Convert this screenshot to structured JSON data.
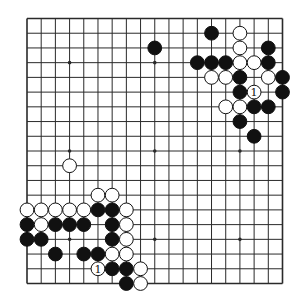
{
  "board": {
    "size": 19,
    "colors": {
      "background": "#ffffff",
      "line": "#2a2a2a",
      "black_stone": "#111111",
      "white_stone": "#ffffff",
      "stone_outline": "#111111"
    },
    "hoshi": [
      [
        3,
        3
      ],
      [
        9,
        3
      ],
      [
        15,
        3
      ],
      [
        3,
        9
      ],
      [
        9,
        9
      ],
      [
        15,
        9
      ],
      [
        3,
        15
      ],
      [
        9,
        15
      ],
      [
        15,
        15
      ]
    ],
    "stones": [
      {
        "color": "black",
        "col": 13,
        "row": 1
      },
      {
        "color": "white",
        "col": 15,
        "row": 1
      },
      {
        "color": "black",
        "col": 9,
        "row": 2
      },
      {
        "color": "white",
        "col": 15,
        "row": 2
      },
      {
        "color": "black",
        "col": 17,
        "row": 2
      },
      {
        "color": "black",
        "col": 12,
        "row": 3
      },
      {
        "color": "black",
        "col": 13,
        "row": 3
      },
      {
        "color": "black",
        "col": 14,
        "row": 3
      },
      {
        "color": "white",
        "col": 15,
        "row": 3
      },
      {
        "color": "white",
        "col": 16,
        "row": 3
      },
      {
        "color": "black",
        "col": 17,
        "row": 3
      },
      {
        "color": "white",
        "col": 13,
        "row": 4
      },
      {
        "color": "white",
        "col": 14,
        "row": 4
      },
      {
        "color": "black",
        "col": 15,
        "row": 4
      },
      {
        "color": "white",
        "col": 17,
        "row": 4
      },
      {
        "color": "black",
        "col": 18,
        "row": 4
      },
      {
        "color": "black",
        "col": 15,
        "row": 5
      },
      {
        "color": "white",
        "col": 16,
        "row": 5,
        "label": "1"
      },
      {
        "color": "black",
        "col": 18,
        "row": 5
      },
      {
        "color": "white",
        "col": 14,
        "row": 6
      },
      {
        "color": "white",
        "col": 15,
        "row": 6
      },
      {
        "color": "black",
        "col": 16,
        "row": 6
      },
      {
        "color": "black",
        "col": 17,
        "row": 6
      },
      {
        "color": "black",
        "col": 15,
        "row": 7
      },
      {
        "color": "black",
        "col": 16,
        "row": 8
      },
      {
        "color": "white",
        "col": 3,
        "row": 10
      },
      {
        "color": "white",
        "col": 5,
        "row": 12
      },
      {
        "color": "white",
        "col": 6,
        "row": 12
      },
      {
        "color": "white",
        "col": 0,
        "row": 13
      },
      {
        "color": "white",
        "col": 1,
        "row": 13
      },
      {
        "color": "white",
        "col": 2,
        "row": 13
      },
      {
        "color": "white",
        "col": 3,
        "row": 13
      },
      {
        "color": "white",
        "col": 4,
        "row": 13
      },
      {
        "color": "black",
        "col": 5,
        "row": 13
      },
      {
        "color": "black",
        "col": 6,
        "row": 13
      },
      {
        "color": "white",
        "col": 7,
        "row": 13
      },
      {
        "color": "black",
        "col": 0,
        "row": 14
      },
      {
        "color": "white",
        "col": 1,
        "row": 14
      },
      {
        "color": "black",
        "col": 2,
        "row": 14
      },
      {
        "color": "black",
        "col": 3,
        "row": 14
      },
      {
        "color": "black",
        "col": 4,
        "row": 14
      },
      {
        "color": "black",
        "col": 6,
        "row": 14
      },
      {
        "color": "white",
        "col": 7,
        "row": 14
      },
      {
        "color": "black",
        "col": 0,
        "row": 15
      },
      {
        "color": "black",
        "col": 1,
        "row": 15
      },
      {
        "color": "black",
        "col": 6,
        "row": 15
      },
      {
        "color": "white",
        "col": 7,
        "row": 15
      },
      {
        "color": "black",
        "col": 2,
        "row": 16
      },
      {
        "color": "black",
        "col": 4,
        "row": 16
      },
      {
        "color": "black",
        "col": 5,
        "row": 16
      },
      {
        "color": "white",
        "col": 6,
        "row": 16
      },
      {
        "color": "white",
        "col": 7,
        "row": 16
      },
      {
        "color": "white",
        "col": 5,
        "row": 17,
        "label": "1"
      },
      {
        "color": "black",
        "col": 6,
        "row": 17
      },
      {
        "color": "black",
        "col": 7,
        "row": 17
      },
      {
        "color": "white",
        "col": 8,
        "row": 17
      },
      {
        "color": "black",
        "col": 7,
        "row": 18
      },
      {
        "color": "white",
        "col": 8,
        "row": 18
      }
    ]
  }
}
